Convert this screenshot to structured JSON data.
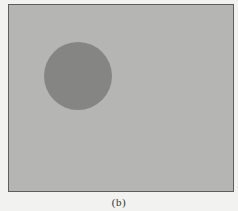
{
  "figure": {
    "caption": "(b)",
    "frame": {
      "fill": "#b5b5b3",
      "border": "#5e5e5e"
    },
    "circle": {
      "cx": 69,
      "cy": 71,
      "r": 34,
      "fill": "#858584"
    }
  }
}
